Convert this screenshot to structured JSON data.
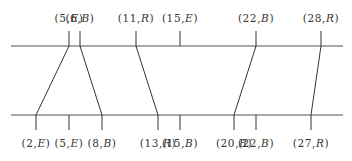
{
  "diagram": {
    "top_line": {
      "y": 46,
      "x1": 11,
      "x2": 343
    },
    "bottom_line": {
      "y": 115,
      "x1": 11,
      "x2": 343
    },
    "top_points": [
      {
        "id": "t0",
        "num": "5",
        "tag": "E",
        "label": "(5,E)",
        "x": 69
      },
      {
        "id": "t1",
        "num": "6",
        "tag": "B",
        "label": "(6,B)",
        "x": 80
      },
      {
        "id": "t2",
        "num": "11",
        "tag": "R",
        "label": "(11,R)",
        "x": 136
      },
      {
        "id": "t3",
        "num": "15",
        "tag": "E",
        "label": "(15,E)",
        "x": 180
      },
      {
        "id": "t4",
        "num": "22",
        "tag": "B",
        "label": "(22,B)",
        "x": 256
      },
      {
        "id": "t5",
        "num": "28",
        "tag": "R",
        "label": "(28,R)",
        "x": 321
      }
    ],
    "bottom_points": [
      {
        "id": "b0",
        "num": "2",
        "tag": "E",
        "label": "(2,E)",
        "x": 36
      },
      {
        "id": "b1",
        "num": "5",
        "tag": "E",
        "label": "(5,E)",
        "x": 69
      },
      {
        "id": "b2",
        "num": "8",
        "tag": "B",
        "label": "(8,B)",
        "x": 102
      },
      {
        "id": "b3",
        "num": "13",
        "tag": "R",
        "label": "(13,R)",
        "x": 158
      },
      {
        "id": "b4",
        "num": "15",
        "tag": "B",
        "label": "(15,B)",
        "x": 180
      },
      {
        "id": "b5",
        "num": "20",
        "tag": "B",
        "label": "(20,B)",
        "x": 234
      },
      {
        "id": "b6",
        "num": "22",
        "tag": "B",
        "label": "(22,B)",
        "x": 256
      },
      {
        "id": "b7",
        "num": "27",
        "tag": "R",
        "label": "(27,R)",
        "x": 311
      }
    ],
    "connections": [
      {
        "from": "(5,E)",
        "to": "(2,E)",
        "x1": 69,
        "x2": 36
      },
      {
        "from": "(6,B)",
        "to": "(8,B)",
        "x1": 80,
        "x2": 102
      },
      {
        "from": "(11,R)",
        "to": "(13,R)",
        "x1": 136,
        "x2": 158
      },
      {
        "from": "(22,B)",
        "to": "(20,B)",
        "x1": 256,
        "x2": 234
      },
      {
        "from": "(28,R)",
        "to": "(27,R)",
        "x1": 321,
        "x2": 311
      }
    ]
  }
}
